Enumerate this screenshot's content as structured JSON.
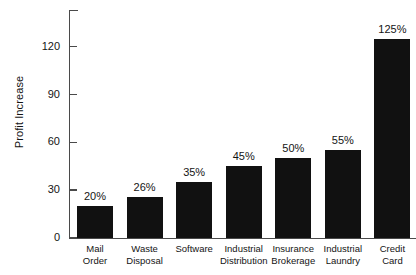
{
  "chart_data": {
    "type": "bar",
    "title": "",
    "xlabel": "",
    "ylabel": "Profit Increase",
    "categories": [
      "Mail Order",
      "Waste Disposal",
      "Software",
      "Industrial Distribution",
      "Insurance Brokerage",
      "Industrial Laundry",
      "Credit Card"
    ],
    "category_lines": [
      [
        "Mail",
        "Order"
      ],
      [
        "Waste",
        "Disposal"
      ],
      [
        "Software"
      ],
      [
        "Industrial",
        "Distribution"
      ],
      [
        "Insurance",
        "Brokerage"
      ],
      [
        "Industrial",
        "Laundry"
      ],
      [
        "Credit",
        "Card"
      ]
    ],
    "values": [
      20,
      26,
      35,
      45,
      50,
      55,
      125
    ],
    "data_labels": [
      "20%",
      "26%",
      "35%",
      "45%",
      "50%",
      "55%",
      "125%"
    ],
    "yticks": [
      0,
      30,
      60,
      90,
      120
    ],
    "ytick_labels": [
      "0",
      "30",
      "60",
      "90",
      "120"
    ],
    "ylim": [
      0,
      143
    ],
    "grid": false,
    "legend": null,
    "bar_color": "#111111",
    "axis_color": "#4a4a4a",
    "text_color": "#141414",
    "background": "#ffffff"
  }
}
